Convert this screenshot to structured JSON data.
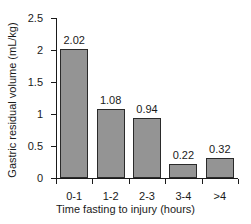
{
  "chart_data": {
    "type": "bar",
    "title": "",
    "categories": [
      "0-1",
      "1-2",
      "2-3",
      "3-4",
      ">4"
    ],
    "values": [
      2.02,
      1.08,
      0.94,
      0.22,
      0.32
    ],
    "value_labels": [
      "2.02",
      "1.08",
      "0.94",
      "0.22",
      "0.32"
    ],
    "xlabel": "Time fasting to injury (hours)",
    "ylabel": "Gastric residual volume (mL/kg)",
    "ylim": [
      0,
      2.5
    ],
    "yticks": [
      0,
      0.5,
      1,
      1.5,
      2,
      2.5
    ],
    "ytick_labels": [
      "0",
      "0.5",
      "1",
      "1.5",
      "2",
      "2.5"
    ],
    "grid": false,
    "legend": false,
    "bar_color": "#949494",
    "bar_edge_color": "#2a2a2a",
    "axis_color": "#1a1a1a",
    "background": "#ffffff"
  }
}
